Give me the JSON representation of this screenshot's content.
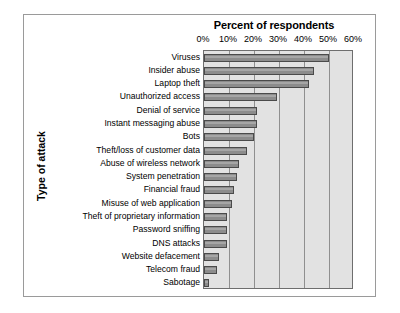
{
  "chart_data": {
    "type": "bar",
    "orientation": "horizontal",
    "title": "Percent of respondents",
    "xlabel": "Percent of respondents",
    "ylabel": "Type of attack",
    "xlim": [
      0,
      60
    ],
    "xticks": [
      0,
      10,
      20,
      30,
      40,
      50,
      60
    ],
    "xticklabels": [
      "0%",
      "10%",
      "20%",
      "30%",
      "40%",
      "50%",
      "60%"
    ],
    "grid": "vertical",
    "legend": "none",
    "categories": [
      "Viruses",
      "Insider abuse",
      "Laptop theft",
      "Unauthorized access",
      "Denial of service",
      "Instant messaging abuse",
      "Bots",
      "Theft/loss of customer data",
      "Abuse of wireless network",
      "System penetration",
      "Financial fraud",
      "Misuse of web application",
      "Theft of proprietary information",
      "Password sniffing",
      "DNS attacks",
      "Website defacement",
      "Telecom fraud",
      "Sabotage"
    ],
    "values": [
      50,
      44,
      42,
      29,
      21,
      21,
      20,
      17,
      14,
      13,
      12,
      11,
      9,
      9,
      9,
      6,
      5,
      2
    ],
    "colors": {
      "bar_fill": "#8c8c8c",
      "bar_edge": "#4a4a4a",
      "plot_background": "#e2e2e2",
      "gridline": "#8f8f8f",
      "frame": "#9a9a9a",
      "page_background": "#ffffff",
      "text": "#000000"
    }
  }
}
